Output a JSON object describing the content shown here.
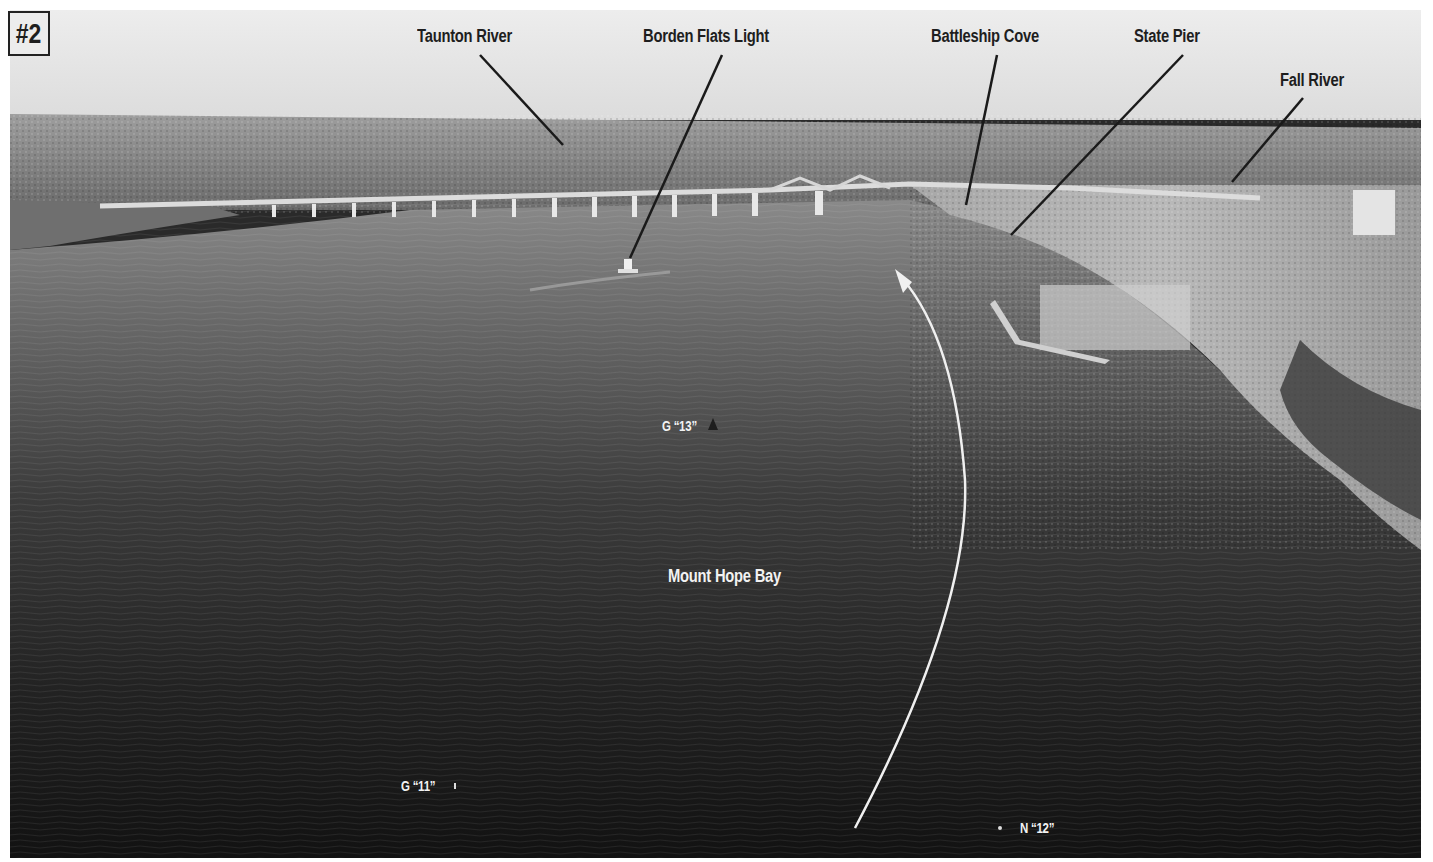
{
  "figure": {
    "plate_number": "#2",
    "colors": {
      "sky": "#e6e6e6",
      "land": "#8a8a8a",
      "water_near_bridge": "#7a7a7a",
      "water_foreground": "#141414",
      "label_dark": "#1e1e1e",
      "label_light": "#f2f2f2",
      "leader_line": "#1a1a1a",
      "course_arrow": "#f0f0f0"
    }
  },
  "callouts": [
    {
      "id": "taunton-river",
      "text": "Taunton River"
    },
    {
      "id": "borden-flats-light",
      "text": "Borden Flats Light"
    },
    {
      "id": "battleship-cove",
      "text": "Battleship Cove"
    },
    {
      "id": "state-pier",
      "text": "State Pier"
    },
    {
      "id": "fall-river",
      "text": "Fall River"
    }
  ],
  "water_labels": {
    "bay_name": "Mount Hope Bay",
    "buoy_g13": "G “13”",
    "buoy_g11": "G “11”",
    "buoy_n12": "N “12”"
  }
}
